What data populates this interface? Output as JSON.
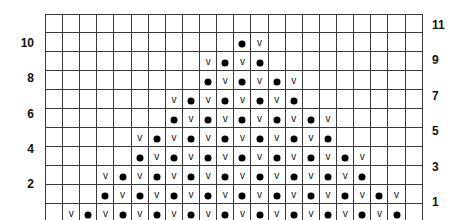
{
  "chart_data": {
    "type": "table",
    "title": "",
    "columns": 22,
    "rows": 11,
    "row_labels_left": [
      "10",
      "8",
      "6",
      "4",
      "2"
    ],
    "row_labels_right": [
      "11",
      "9",
      "7",
      "5",
      "3",
      "1"
    ],
    "legend": {
      "v": "v",
      "dot": "filled-dot"
    },
    "grid_rows_top_to_bottom": [
      {
        "row": 11,
        "cells": "                      "
      },
      {
        "row": 10,
        "cells": "           .v         "
      },
      {
        "row": 9,
        "cells": "         v.v.         "
      },
      {
        "row": 8,
        "cells": "         .v.v.v       "
      },
      {
        "row": 7,
        "cells": "       v.v.v.v.       "
      },
      {
        "row": 6,
        "cells": "       .v.v.v.v.v     "
      },
      {
        "row": 5,
        "cells": "     v.v.v.v.v.v.     "
      },
      {
        "row": 4,
        "cells": "     .v.v.v.v.v.v.v   "
      },
      {
        "row": 3,
        "cells": "   v.v.v.v.v.v.v.v.   "
      },
      {
        "row": 2,
        "cells": "   .v.v.v.v.v.v.v.v.v "
      },
      {
        "row": 1,
        "cells": " v.v.v.v.v.v.v.v.v.v. "
      }
    ]
  },
  "labels": {
    "left": [
      {
        "text": "10",
        "row_index": 1
      },
      {
        "text": "8",
        "row_index": 3
      },
      {
        "text": "6",
        "row_index": 5
      },
      {
        "text": "4",
        "row_index": 7
      },
      {
        "text": "2",
        "row_index": 9
      }
    ],
    "right": [
      {
        "text": "11",
        "row_index": 0
      },
      {
        "text": "9",
        "row_index": 2
      },
      {
        "text": "7",
        "row_index": 4
      },
      {
        "text": "5",
        "row_index": 6
      },
      {
        "text": "3",
        "row_index": 8
      },
      {
        "text": "1",
        "row_index": 10
      }
    ]
  },
  "symbols": {
    "v": "v",
    "dot": "dot-icon"
  },
  "colors": {
    "grid_line": "#3a3a3a",
    "symbol": "#000000",
    "background": "#ffffff"
  }
}
